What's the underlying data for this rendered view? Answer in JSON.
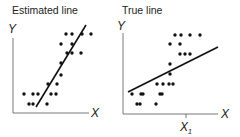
{
  "panels": [
    {
      "title": "Estimated line",
      "x_label": "X",
      "y_label": "Y",
      "points": [
        [
          66,
          34
        ],
        [
          72,
          34
        ],
        [
          82,
          34
        ],
        [
          91,
          34
        ],
        [
          61,
          44
        ],
        [
          72,
          44
        ],
        [
          67,
          53
        ],
        [
          72,
          53
        ],
        [
          81,
          53
        ],
        [
          61,
          63
        ],
        [
          61,
          75
        ],
        [
          48,
          84
        ],
        [
          57,
          84
        ],
        [
          24,
          94
        ],
        [
          33,
          94
        ],
        [
          38,
          94
        ],
        [
          51,
          94
        ],
        [
          56,
          94
        ],
        [
          29,
          104
        ],
        [
          33,
          104
        ],
        [
          47,
          104
        ]
      ],
      "line": [
        [
          36,
          107
        ],
        [
          86,
          25
        ]
      ]
    },
    {
      "title": "True line",
      "x_label": "X",
      "y_label": "Y",
      "x_tick_label": "X",
      "x_tick_sub": "1",
      "points": [
        [
          175,
          35
        ],
        [
          181,
          35
        ],
        [
          190,
          35
        ],
        [
          200,
          35
        ],
        [
          170,
          44
        ],
        [
          180,
          44
        ],
        [
          180,
          54
        ],
        [
          185,
          54
        ],
        [
          190,
          54
        ],
        [
          170,
          64
        ],
        [
          170,
          74
        ],
        [
          157,
          84
        ],
        [
          163,
          84
        ],
        [
          169,
          84
        ],
        [
          173,
          84
        ],
        [
          132,
          94
        ],
        [
          141,
          94
        ],
        [
          143,
          94
        ],
        [
          160,
          94
        ],
        [
          162,
          94
        ],
        [
          137,
          104
        ],
        [
          140,
          104
        ],
        [
          156,
          104
        ]
      ],
      "line": [
        [
          128,
          92
        ],
        [
          218,
          47
        ]
      ]
    }
  ],
  "chart_data": [
    {
      "type": "scatter",
      "title": "Estimated line",
      "xlabel": "X",
      "ylabel": "Y",
      "annotations": [
        "steep fitted line through the points"
      ]
    },
    {
      "type": "scatter",
      "title": "True line",
      "xlabel": "X",
      "ylabel": "Y",
      "annotations": [
        "shallower true line",
        "tick X1 on x-axis"
      ]
    }
  ]
}
